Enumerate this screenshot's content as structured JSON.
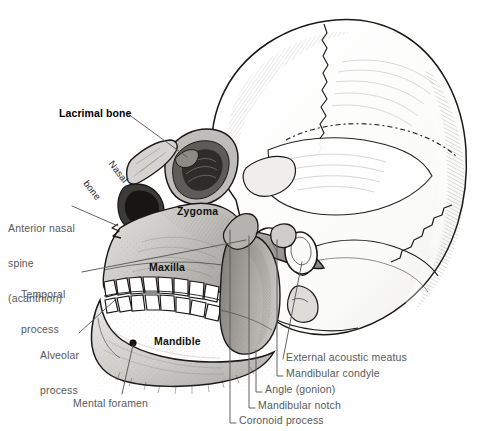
{
  "figure": {
    "background_color": "#ffffff",
    "label_color": "#58595b",
    "bold_label_color": "#000000",
    "bone_shade_color": "#c9c7c4",
    "outline_color": "#1a1a1a",
    "width": 486,
    "height": 431
  },
  "callout_labels": [
    {
      "id": "lacrimal-bone",
      "text": "Lacrimal bone",
      "style": "bold",
      "lines": [
        "Lacrimal bone"
      ],
      "x": 59,
      "y": 108,
      "leader": "diagonal"
    },
    {
      "id": "anterior-nasal-spine",
      "text": "Anterior nasal spine (acanthion)",
      "style": "plain",
      "lines": [
        "Anterior nasal",
        "spine",
        "(acanthion)"
      ],
      "x": 8,
      "y": 200,
      "leader": "diagonal"
    },
    {
      "id": "temporal-process",
      "text": "Temporal process",
      "style": "plain",
      "lines": [
        "Temporal",
        "process"
      ],
      "x": 21,
      "y": 266,
      "leader": "diagonal"
    },
    {
      "id": "alveolar-process",
      "text": "Alveolar process",
      "style": "plain",
      "lines": [
        "Alveolar",
        "process"
      ],
      "x": 40,
      "y": 327,
      "leader": "diagonal"
    },
    {
      "id": "mental-foramen",
      "text": "Mental foramen",
      "style": "plain",
      "lines": [
        "Mental foramen"
      ],
      "x": 73,
      "y": 398,
      "leader": "diagonal"
    },
    {
      "id": "external-acoustic-meatus",
      "text": "External acoustic meatus",
      "style": "plain",
      "lines": [
        "External acoustic meatus"
      ],
      "x": 286,
      "y": 357,
      "leader": "diagonal"
    },
    {
      "id": "mandibular-condyle",
      "text": "Mandibular condyle",
      "style": "plain",
      "lines": [
        "Mandibular condyle"
      ],
      "x": 286,
      "y": 373,
      "leader": "elbow"
    },
    {
      "id": "angle-gonion",
      "text": "Angle (gonion)",
      "style": "plain",
      "lines": [
        "Angle (gonion)"
      ],
      "x": 265,
      "y": 389,
      "leader": "elbow"
    },
    {
      "id": "mandibular-notch",
      "text": "Mandibular notch",
      "style": "plain",
      "lines": [
        "Mandibular notch"
      ],
      "x": 258,
      "y": 405,
      "leader": "elbow"
    },
    {
      "id": "coronoid-process",
      "text": "Coronoid process",
      "style": "plain",
      "lines": [
        "Coronoid process"
      ],
      "x": 239,
      "y": 420,
      "leader": "elbow"
    }
  ],
  "bone_labels": [
    {
      "id": "nasal-bone",
      "text": "Nasal bone",
      "lines": [
        "Nasal",
        "bone"
      ],
      "x": 131,
      "y": 146,
      "rotation_deg": 52,
      "style": "plain-rotated"
    },
    {
      "id": "zygoma",
      "text": "Zygoma",
      "lines": [
        "Zygoma"
      ],
      "x": 177,
      "y": 206,
      "style": "bold-on-bone"
    },
    {
      "id": "maxilla",
      "text": "Maxilla",
      "lines": [
        "Maxilla"
      ],
      "x": 149,
      "y": 262,
      "style": "bold-on-bone"
    },
    {
      "id": "mandible",
      "text": "Mandible",
      "lines": [
        "Mandible"
      ],
      "x": 154,
      "y": 336,
      "style": "bold-on-bone"
    }
  ]
}
